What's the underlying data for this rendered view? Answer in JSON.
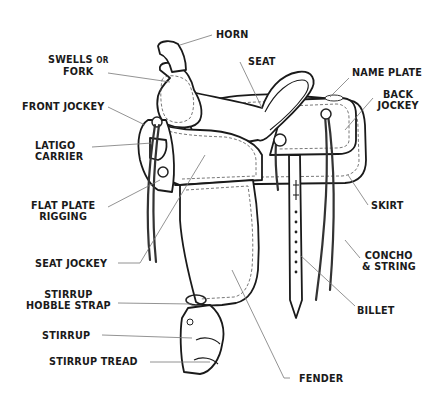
{
  "diagram": {
    "labels": [
      {
        "id": "horn",
        "text": "HORN"
      },
      {
        "id": "swells",
        "line1": "SWELLS",
        "line1_small": "OR",
        "line2": "FORK"
      },
      {
        "id": "seat",
        "text": "SEAT"
      },
      {
        "id": "name_plate",
        "text": "NAME PLATE"
      },
      {
        "id": "back_jockey",
        "line1": "BACK",
        "line2": "JOCKEY"
      },
      {
        "id": "front_jockey",
        "text": "FRONT JOCKEY"
      },
      {
        "id": "latigo_carrier",
        "line1": "LATIGO",
        "line2": "CARRIER"
      },
      {
        "id": "flat_plate_rigging",
        "line1": "FLAT PLATE",
        "line2": "RIGGING"
      },
      {
        "id": "skirt",
        "text": "SKIRT"
      },
      {
        "id": "concho_string",
        "line1": "CONCHO",
        "line2": "& STRING"
      },
      {
        "id": "seat_jockey",
        "text": "SEAT JOCKEY"
      },
      {
        "id": "stirrup_hobble_strap",
        "line1": "STIRRUP",
        "line2": "HOBBLE STRAP"
      },
      {
        "id": "billet",
        "text": "BILLET"
      },
      {
        "id": "stirrup",
        "text": "STIRRUP"
      },
      {
        "id": "stirrup_tread",
        "text": "STIRRUP TREAD"
      },
      {
        "id": "fender",
        "text": "FENDER"
      }
    ]
  }
}
